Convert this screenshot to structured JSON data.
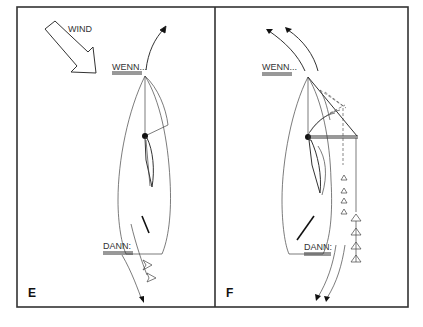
{
  "figure": {
    "colors": {
      "line": "#333333",
      "background": "#ffffff",
      "fill": "#ffffff"
    },
    "panels": [
      {
        "id": "E",
        "letter": "E",
        "labels": {
          "wind": "WIND",
          "if": "WENN...",
          "then": "DANN:"
        },
        "icons": [
          "wind-arrow-icon",
          "turn-arrow-icon",
          "boat-hull-icon",
          "mainsail-icon",
          "jib-icon",
          "tiller-icon",
          "telltale-icon"
        ]
      },
      {
        "id": "F",
        "letter": "F",
        "labels": {
          "if": "WENN...",
          "then": "DANN:"
        },
        "icons": [
          "turn-arrow-icon",
          "boat-hull-icon",
          "mainsail-icon",
          "jib-icon",
          "boom-icon",
          "tiller-icon",
          "telltale-icon"
        ]
      }
    ]
  }
}
